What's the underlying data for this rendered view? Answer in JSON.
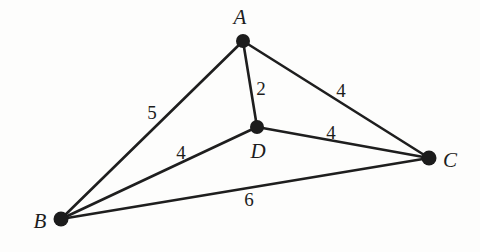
{
  "figure": {
    "background_color": "#fdfdfc",
    "ink_color": "#1d1d1d",
    "width": 480,
    "height": 252
  },
  "nodes": [
    {
      "id": "A",
      "label": "A",
      "x": 243,
      "y": 41,
      "r": 7,
      "label_x": 240,
      "label_y": 24
    },
    {
      "id": "B",
      "label": "B",
      "x": 61,
      "y": 219,
      "r": 7.5,
      "label_x": 40,
      "label_y": 228
    },
    {
      "id": "C",
      "label": "C",
      "x": 429,
      "y": 158,
      "r": 7.5,
      "label_x": 450,
      "label_y": 167
    },
    {
      "id": "D",
      "label": "D",
      "x": 257,
      "y": 127,
      "r": 7,
      "label_x": 258,
      "label_y": 158
    }
  ],
  "edges": [
    {
      "id": "AB",
      "from": "A",
      "to": "B",
      "weight": "5",
      "weight_x": 152,
      "weight_y": 119
    },
    {
      "id": "AD",
      "from": "A",
      "to": "D",
      "weight": "2",
      "weight_x": 261,
      "weight_y": 95
    },
    {
      "id": "AC",
      "from": "A",
      "to": "C",
      "weight": "4",
      "weight_x": 341,
      "weight_y": 97
    },
    {
      "id": "DC",
      "from": "D",
      "to": "C",
      "weight": "4",
      "weight_x": 331,
      "weight_y": 139
    },
    {
      "id": "BD",
      "from": "B",
      "to": "D",
      "weight": "4",
      "weight_x": 181,
      "weight_y": 159
    },
    {
      "id": "BC",
      "from": "B",
      "to": "C",
      "weight": "6",
      "weight_x": 249,
      "weight_y": 206
    }
  ],
  "chart_data": {
    "type": "diagram",
    "diagram_kind": "weighted-undirected-graph",
    "vertices": [
      "A",
      "B",
      "C",
      "D"
    ],
    "edge_list": [
      {
        "endpoints": [
          "A",
          "B"
        ],
        "weight": 5
      },
      {
        "endpoints": [
          "A",
          "D"
        ],
        "weight": 2
      },
      {
        "endpoints": [
          "A",
          "C"
        ],
        "weight": 4
      },
      {
        "endpoints": [
          "D",
          "C"
        ],
        "weight": 4
      },
      {
        "endpoints": [
          "B",
          "D"
        ],
        "weight": 4
      },
      {
        "endpoints": [
          "B",
          "C"
        ],
        "weight": 6
      }
    ],
    "title": "",
    "legend": []
  }
}
